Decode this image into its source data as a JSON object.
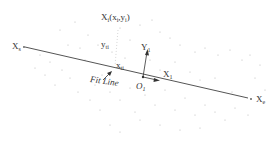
{
  "diagram": {
    "type": "fit-line-with-local-frame",
    "labels": {
      "point": {
        "main": "X",
        "sub": "i",
        "args": "(x",
        "args_sub1": "i",
        "mid": ",y",
        "args_sub2": "i",
        "close": ")"
      },
      "y_dist": {
        "main": "y",
        "sub": "ti"
      },
      "x_start": {
        "main": "X",
        "sub": "s"
      },
      "x_end": {
        "main": "X",
        "sub": "e"
      },
      "x_foot": {
        "main": "x",
        "sub": "ti"
      },
      "origin": {
        "main": "O",
        "sub": "1"
      },
      "y_axis": {
        "main": "Y",
        "sub": "1"
      },
      "x_axis": {
        "main": "X",
        "sub": "1"
      },
      "fit_line": "Fit Line"
    },
    "colors": {
      "line": "#555555",
      "dots": "#b0b0b0",
      "text": "#333333"
    }
  }
}
